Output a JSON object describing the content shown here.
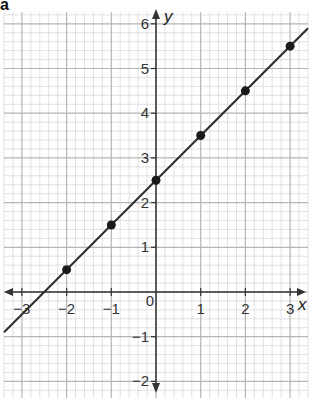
{
  "part_label": "a",
  "chart_data": {
    "type": "scatter",
    "title": "",
    "xlabel": "x",
    "ylabel": "y",
    "xlim": [
      -3.4,
      3.4
    ],
    "ylim": [
      -2.35,
      6.3
    ],
    "grid": true,
    "grid_minor_per_unit": 5,
    "x_ticks": [
      -3,
      -2,
      -1,
      0,
      1,
      2,
      3
    ],
    "x_tick_labels": [
      "−3",
      "−2",
      "−1",
      "0",
      "1",
      "2",
      "3"
    ],
    "y_ticks": [
      -2,
      -1,
      1,
      2,
      3,
      4,
      5,
      6
    ],
    "y_tick_labels": [
      "−2",
      "−1",
      "1",
      "2",
      "3",
      "4",
      "5",
      "6"
    ],
    "series": [
      {
        "name": "points",
        "type": "scatter",
        "x": [
          -2,
          -1,
          0,
          1,
          2,
          3
        ],
        "y": [
          0.5,
          1.5,
          2.5,
          3.5,
          4.5,
          5.5
        ]
      },
      {
        "name": "line y = x + 2.5",
        "type": "line",
        "slope": 1,
        "intercept": 2.5,
        "x": [
          -3.4,
          3.4
        ],
        "y": [
          -0.9,
          5.9
        ]
      }
    ],
    "colors": {
      "grid_minor": "#d9d9d9",
      "grid_major": "#b5b5b5",
      "axis": "#333333",
      "line": "#2a2a2a",
      "point": "#1a1a1a"
    }
  }
}
